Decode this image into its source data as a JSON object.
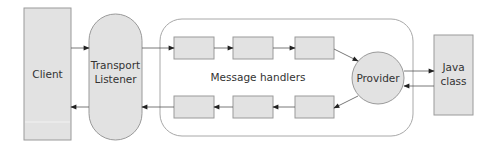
{
  "diagram": {
    "client": {
      "label": "Client"
    },
    "transport": {
      "lines": [
        "Transport",
        "Listener"
      ]
    },
    "message_handlers": {
      "label": "Message handlers"
    },
    "provider": {
      "label": "Provider"
    },
    "java_class": {
      "lines": [
        "Java",
        "class"
      ]
    },
    "colors": {
      "fill": "#e2e2e2",
      "stroke": "#9a9a9a",
      "line": "#555555",
      "arrowhead": "#222222",
      "container_stroke": "#a8a8a8"
    }
  }
}
